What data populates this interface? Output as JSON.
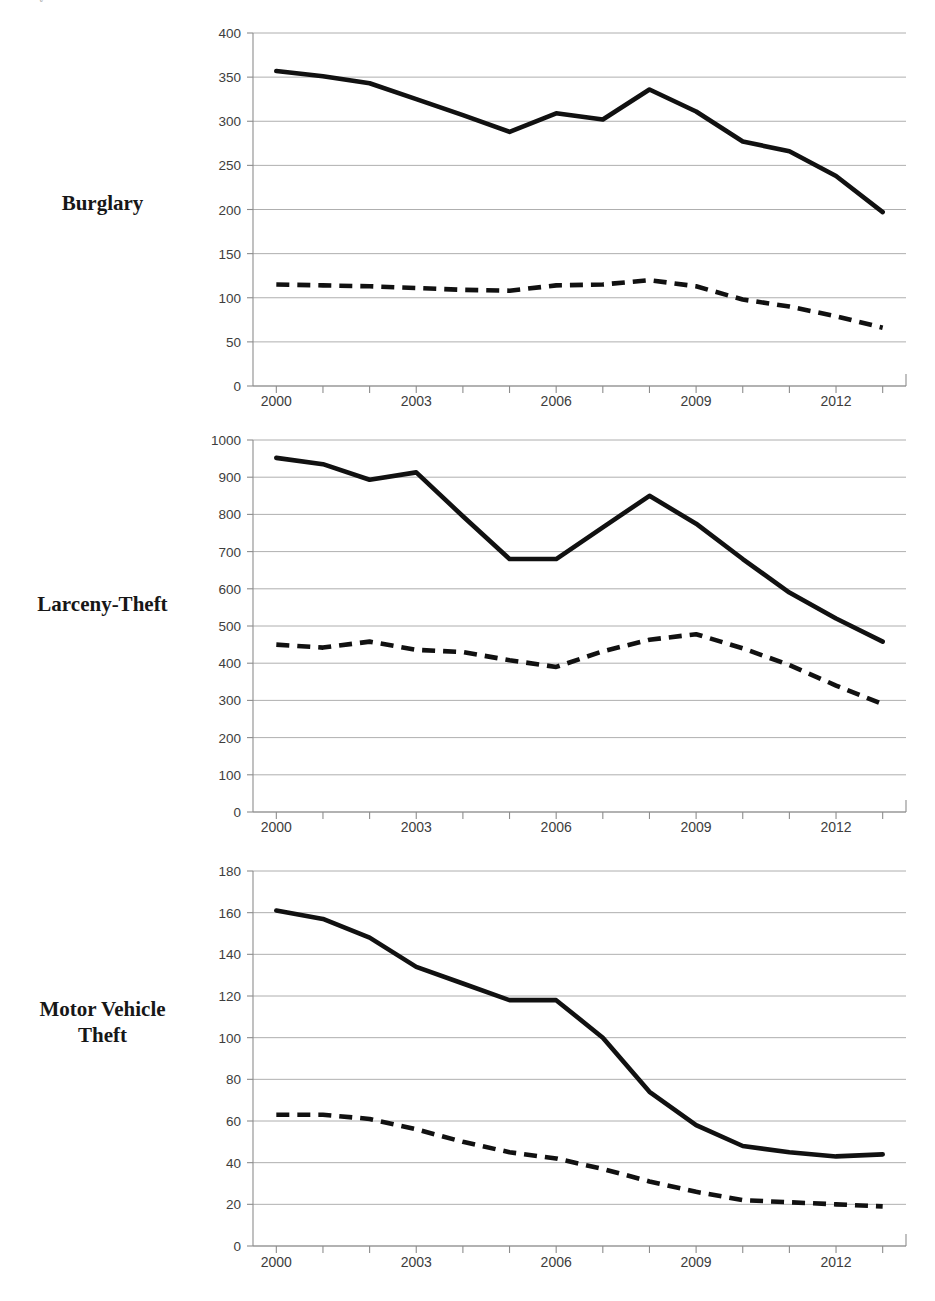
{
  "page": {
    "clipped_header_text": "y ,"
  },
  "panels": [
    {
      "label": "Burglary",
      "label_lines": [
        "Burglary"
      ]
    },
    {
      "label": "Larceny-Theft",
      "label_lines": [
        "Larceny-Theft"
      ]
    },
    {
      "label": "Motor Vehicle Theft",
      "label_lines": [
        "Motor Vehicle",
        "Theft"
      ]
    }
  ],
  "chart_data": [
    {
      "type": "line",
      "title": "Burglary",
      "xlabel": "",
      "ylabel": "",
      "x": [
        2000,
        2001,
        2002,
        2003,
        2004,
        2005,
        2006,
        2007,
        2008,
        2009,
        2010,
        2011,
        2012,
        2013
      ],
      "xlim": [
        1999.5,
        2013.5
      ],
      "ylim": [
        0,
        400
      ],
      "ytick_labels": [
        "400",
        "350",
        "300",
        "250",
        "200",
        "150",
        "100",
        "50",
        "0"
      ],
      "yticks": [
        400,
        350,
        300,
        250,
        200,
        150,
        100,
        50,
        0
      ],
      "xtick_labels": [
        "2000",
        "2003",
        "2006",
        "2009",
        "2012"
      ],
      "xticks": [
        2000,
        2003,
        2006,
        2009,
        2012
      ],
      "grid": true,
      "legend_position": "none",
      "series": [
        {
          "name": "solid-series",
          "style": "solid",
          "values": [
            357,
            351,
            343,
            325,
            307,
            288,
            309,
            302,
            336,
            311,
            277,
            266,
            238,
            197
          ]
        },
        {
          "name": "dashed-series",
          "style": "dashed",
          "values": [
            115,
            114,
            113,
            111,
            109,
            108,
            114,
            115,
            120,
            113,
            98,
            90,
            79,
            66
          ]
        }
      ]
    },
    {
      "type": "line",
      "title": "Larceny-Theft",
      "xlabel": "",
      "ylabel": "",
      "x": [
        2000,
        2001,
        2002,
        2003,
        2004,
        2005,
        2006,
        2007,
        2008,
        2009,
        2010,
        2011,
        2012,
        2013
      ],
      "xlim": [
        1999.5,
        2013.5
      ],
      "ylim": [
        0,
        1000
      ],
      "ytick_labels": [
        "1000",
        "900",
        "800",
        "700",
        "600",
        "500",
        "400",
        "300",
        "200",
        "100",
        "0"
      ],
      "yticks": [
        1000,
        900,
        800,
        700,
        600,
        500,
        400,
        300,
        200,
        100,
        0
      ],
      "xtick_labels": [
        "2000",
        "2003",
        "2006",
        "2009",
        "2012"
      ],
      "xticks": [
        2000,
        2003,
        2006,
        2009,
        2012
      ],
      "grid": true,
      "legend_position": "none",
      "series": [
        {
          "name": "solid-series",
          "style": "solid",
          "values": [
            952,
            935,
            893,
            913,
            795,
            680,
            680,
            765,
            850,
            775,
            680,
            590,
            520,
            458
          ]
        },
        {
          "name": "dashed-series",
          "style": "dashed",
          "values": [
            450,
            442,
            458,
            436,
            430,
            408,
            390,
            432,
            463,
            478,
            440,
            395,
            340,
            290
          ]
        }
      ]
    },
    {
      "type": "line",
      "title": "Motor Vehicle Theft",
      "xlabel": "",
      "ylabel": "",
      "x": [
        2000,
        2001,
        2002,
        2003,
        2004,
        2005,
        2006,
        2007,
        2008,
        2009,
        2010,
        2011,
        2012,
        2013
      ],
      "xlim": [
        1999.5,
        2013.5
      ],
      "ylim": [
        0,
        180
      ],
      "ytick_labels": [
        "180",
        "160",
        "140",
        "120",
        "100",
        "80",
        "60",
        "40",
        "20",
        "0"
      ],
      "yticks": [
        180,
        160,
        140,
        120,
        100,
        80,
        60,
        40,
        20,
        0
      ],
      "xtick_labels": [
        "2000",
        "2003",
        "2006",
        "2009",
        "2012"
      ],
      "xticks": [
        2000,
        2003,
        2006,
        2009,
        2012
      ],
      "grid": true,
      "legend_position": "none",
      "series": [
        {
          "name": "solid-series",
          "style": "solid",
          "values": [
            161,
            157,
            148,
            134,
            126,
            118,
            118,
            100,
            74,
            58,
            48,
            45,
            43,
            44
          ]
        },
        {
          "name": "dashed-series",
          "style": "dashed",
          "values": [
            63,
            63,
            61,
            56,
            50,
            45,
            42,
            37,
            31,
            26,
            22,
            21,
            20,
            19
          ]
        }
      ]
    }
  ]
}
